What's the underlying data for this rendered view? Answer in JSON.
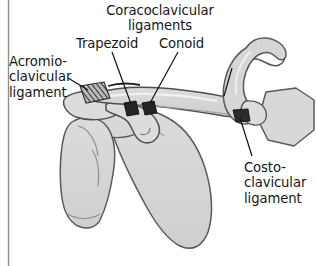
{
  "figure": {
    "background_color": "#ffffff",
    "frame_rule_color": "#8e8e8e",
    "bone_fill": "#d4d4d4",
    "bone_outline": "#5a5a5a",
    "highlight_fill": "#ececec",
    "ligament_dark": "#2b2b2b",
    "leader_color": "#111111",
    "text_color": "#161616"
  },
  "labels": {
    "coracoclavicular": {
      "line1": "Coracoclavicular",
      "line2": "ligaments"
    },
    "trapezoid": "Trapezoid",
    "conoid": "Conoid",
    "acromioclavicular": {
      "line1": "Acromio-",
      "line2": "clavicular",
      "line3": "ligament"
    },
    "costoclavicular": {
      "line1": "Costo-",
      "line2": "clavicular",
      "line3": "ligament"
    }
  },
  "structures": [
    {
      "name": "clavicle",
      "label": "Clavicle"
    },
    {
      "name": "scapula",
      "label": "Scapula"
    },
    {
      "name": "acromion",
      "label": "Acromion"
    },
    {
      "name": "coracoid-process",
      "label": "Coracoid process"
    },
    {
      "name": "humerus-head",
      "label": "Head of humerus"
    },
    {
      "name": "first-rib",
      "label": "First rib"
    },
    {
      "name": "manubrium",
      "label": "Manubrium of sternum"
    }
  ],
  "ligaments": [
    {
      "name": "acromioclavicular-ligament",
      "style": "hatched"
    },
    {
      "name": "trapezoid-ligament",
      "style": "solid-dark"
    },
    {
      "name": "conoid-ligament",
      "style": "solid-dark"
    },
    {
      "name": "costoclavicular-ligament",
      "style": "solid-dark"
    }
  ]
}
